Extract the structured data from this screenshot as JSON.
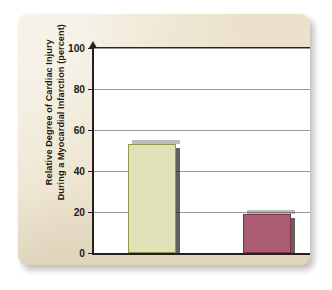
{
  "figure": {
    "card_color": "#ece2cb",
    "plot_background": "#ffffff"
  },
  "chart_data": {
    "type": "bar",
    "title": "",
    "xlabel": "",
    "ylabel": "Relative Degree of Cardiac Injury\nDuring a Myocardial Infarction (percent)",
    "categories": [
      "Untrained\nIndividual",
      "Trained\nIndividual"
    ],
    "values": [
      53,
      19
    ],
    "ylim": [
      0,
      100
    ],
    "yticks": [
      0,
      20,
      40,
      60,
      80,
      100
    ],
    "ytick_labels": [
      "0",
      "20",
      "40",
      "60",
      "80",
      "100"
    ],
    "grid": "horizontal",
    "legend": "none",
    "bar_colors": [
      "#dfe2b6",
      "#ab5c72"
    ],
    "bar_edge_colors": [
      "#8f9a4e",
      "#7c3247"
    ]
  }
}
